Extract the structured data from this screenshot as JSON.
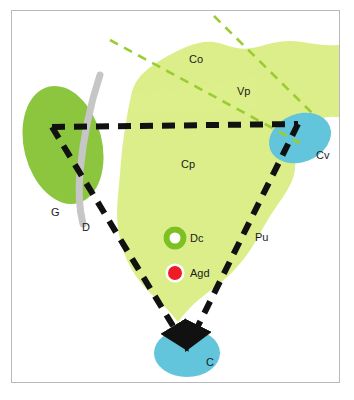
{
  "figure": {
    "caption": ""
  },
  "palette": {
    "frame_border": "#b9b9b9",
    "background": "#ffffff",
    "dark_green": "#8cc63e",
    "light_green": "#dcee8a",
    "blue": "#62c5dc",
    "gray_band": "#c6c6c6",
    "dashed_black": "#111111",
    "dashed_green": "#9acd32",
    "marker_red": "#ee1c24",
    "marker_ring_green": "#7cc022",
    "marker_white": "#ffffff"
  },
  "regions": [
    {
      "id": "G",
      "label": "G",
      "shape": "ellipse",
      "color": "#8cc63e",
      "x": 57,
      "y": 213
    },
    {
      "id": "D",
      "label": "D",
      "shape": "curved-band",
      "color": "#c6c6c6",
      "x": 86,
      "y": 228
    },
    {
      "id": "Co",
      "label": "Co",
      "shape": "amoeba-region",
      "color": "#dcee8a",
      "x": 196,
      "y": 60
    },
    {
      "id": "Vp",
      "label": "Vp",
      "shape": "amoeba-region",
      "color": "#dcee8a",
      "x": 244,
      "y": 92
    },
    {
      "id": "Cp",
      "label": "Cp",
      "shape": "amoeba-region",
      "color": "#dcee8a",
      "x": 188,
      "y": 165
    },
    {
      "id": "Cv",
      "label": "Cv",
      "shape": "ellipse",
      "color": "#62c5dc",
      "x": 323,
      "y": 156
    },
    {
      "id": "Pu",
      "label": "Pu",
      "shape": "pathway-label",
      "color": "#111111",
      "x": 261,
      "y": 238
    },
    {
      "id": "C",
      "label": "C",
      "shape": "ellipse",
      "color": "#62c5dc",
      "x": 211,
      "y": 363
    }
  ],
  "markers": [
    {
      "id": "Dc",
      "label": "Dc",
      "glyph": "ring-marker",
      "fill": "#ffffff",
      "ring": "#7cc022",
      "cx": 175,
      "cy": 238,
      "label_x": 190,
      "label_y": 234
    },
    {
      "id": "Agd",
      "label": "Agd",
      "glyph": "dot-marker",
      "fill": "#ee1c24",
      "ring": "#ffffff",
      "cx": 175,
      "cy": 273,
      "label_x": 190,
      "label_y": 269
    }
  ],
  "pathways": {
    "black_triangle": {
      "name": "dashed-black-triangle",
      "style": "dashed",
      "color": "#111111",
      "vertices": [
        [
          52,
          127
        ],
        [
          298,
          124
        ],
        [
          186,
          348
        ]
      ],
      "arrowhead_at": [
        186,
        348
      ]
    },
    "green_lines": [
      {
        "name": "dashed-green-line-left",
        "style": "dashed",
        "color": "#9acd32",
        "from": [
          110,
          40
        ],
        "to": [
          300,
          143
        ]
      },
      {
        "name": "dashed-green-line-right",
        "style": "dashed",
        "color": "#9acd32",
        "from": [
          214,
          16
        ],
        "to": [
          312,
          113
        ]
      }
    ]
  }
}
